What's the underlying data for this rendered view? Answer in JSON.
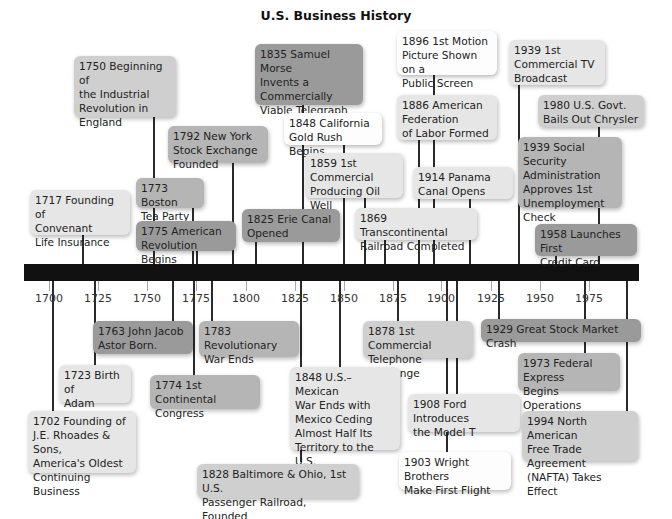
{
  "title": "U.S. Business History",
  "axis": {
    "ticks": [
      "1700",
      "1725",
      "1750",
      "1775",
      "1800",
      "1825",
      "1850",
      "1875",
      "1900",
      "1925",
      "1950",
      "1975"
    ]
  },
  "events_above": [
    {
      "year": "1750",
      "text": "1750 Beginning of\nthe Industrial\nRevolution in\nEngland"
    },
    {
      "year": "1835",
      "text": "1835 Samuel Morse\nInvents a\nCommercially\nViable Telegraph"
    },
    {
      "year": "1896",
      "text": "1896 1st Motion\nPicture Shown on a\nPublic Screen"
    },
    {
      "year": "1939",
      "text": "1939 1st\nCommercial TV\nBroadcast"
    },
    {
      "year": "1848",
      "text": "1848 California\nGold Rush Begins"
    },
    {
      "year": "1886",
      "text": "1886 American\nFederation\nof Labor Formed"
    },
    {
      "year": "1980",
      "text": "1980 U.S. Govt.\nBails Out Chrysler"
    },
    {
      "year": "1792",
      "text": "1792 New York\nStock Exchange\nFounded"
    },
    {
      "year": "1859",
      "text": "1859 1st\nCommercial\nProducing Oil Well"
    },
    {
      "year": "1939b",
      "text": "1939 Social Security\nAdministration\nApproves 1st\nUnemployment\nCheck"
    },
    {
      "year": "1914",
      "text": "1914 Panama\nCanal Opens"
    },
    {
      "year": "1717",
      "text": "1717 Founding of\nConvenant\nLife Insurance"
    },
    {
      "year": "1773",
      "text": "1773 Boston\nTea Party"
    },
    {
      "year": "1775",
      "text": "1775 American\nRevolution Begins"
    },
    {
      "year": "1825",
      "text": "1825 Erie Canal\nOpened"
    },
    {
      "year": "1869",
      "text": "1869 Transcontinental\nRailroad Completed"
    },
    {
      "year": "1958",
      "text": "1958 Launches First\nCredit Card"
    }
  ],
  "events_below": [
    {
      "year": "1763",
      "text": "1763 John Jacob\nAstor Born."
    },
    {
      "year": "1783",
      "text": "1783 Revolutionary\nWar Ends"
    },
    {
      "year": "1878",
      "text": "1878 1st Commercial\nTelephone Exchange"
    },
    {
      "year": "1929",
      "text": "1929 Great Stock Market Crash"
    },
    {
      "year": "1723",
      "text": "1723 Birth of\nAdam Smith"
    },
    {
      "year": "1774",
      "text": "1774 1st Continental\nCongress"
    },
    {
      "year": "1848",
      "text": "1848 U.S.–Mexican\nWar Ends with\nMexico Ceding\nAlmost Half Its\nTerritory to the U.S."
    },
    {
      "year": "1973",
      "text": "1973 Federal Express\nBegins Operations"
    },
    {
      "year": "1908",
      "text": "1908 Ford Introduces\nthe Model T"
    },
    {
      "year": "1702",
      "text": "1702 Founding of\nJ.E. Rhoades & Sons,\nAmerica's Oldest\nContinuing Business"
    },
    {
      "year": "1994",
      "text": "1994 North American\nFree Trade Agreement\n(NAFTA) Takes Effect"
    },
    {
      "year": "1903",
      "text": "1903 Wright Brothers\nMake First Flight"
    },
    {
      "year": "1828",
      "text": "1828 Baltimore & Ohio, 1st U.S.\nPassenger Railroad, Founded"
    }
  ]
}
